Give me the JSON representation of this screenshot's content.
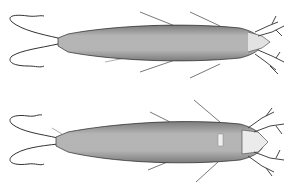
{
  "figure": {
    "specimens": [
      {
        "name": "specimen-dorsal-view",
        "position": "top"
      },
      {
        "name": "specimen-ventral-view",
        "position": "bottom"
      }
    ],
    "colors": {
      "background": "#ffffff",
      "body_fill": "#c8c8c8",
      "ink": "#3a3a3a"
    }
  }
}
